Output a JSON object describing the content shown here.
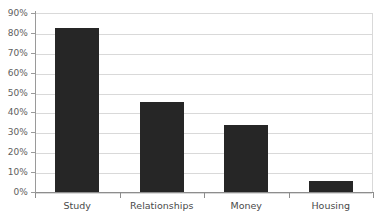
{
  "chart_data": {
    "type": "bar",
    "title": "",
    "subtitle": "",
    "xlabel": "",
    "ylabel": "",
    "categories": [
      "Study",
      "Relationships",
      "Money",
      "Housing"
    ],
    "values": [
      83,
      46,
      34,
      6
    ],
    "value_unit": "%",
    "series": [
      {
        "name": "",
        "values": [
          83,
          46,
          34,
          6
        ]
      }
    ],
    "ylim": [
      0,
      90
    ],
    "ytick_step": 10,
    "ytick_labels": [
      "0%",
      "10%",
      "20%",
      "30%",
      "40%",
      "50%",
      "60%",
      "70%",
      "80%",
      "90%"
    ],
    "ytick_values": [
      0,
      10,
      20,
      30,
      40,
      50,
      60,
      70,
      80,
      90
    ],
    "grid": "horizontal",
    "legend": "none",
    "bar_color": "#262626",
    "gridline_color": "#d9d9d9",
    "axis_color": "#8d8d8d",
    "tick_label_color": "#5e5e5e",
    "category_label_color": "#4a4a4a",
    "background_color": "#ffffff"
  }
}
